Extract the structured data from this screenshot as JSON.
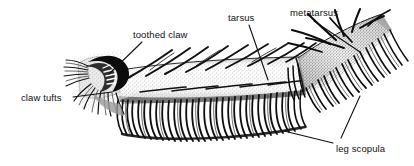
{
  "figure": {
    "kind": "scientific-illustration",
    "style": "black-and-white stippled line drawing",
    "background_color": "#ffffff",
    "ink_color": "#111111",
    "width": 414,
    "height": 166
  },
  "labels": [
    {
      "id": "claw-tufts",
      "text": "claw tufts",
      "x": 21,
      "y": 93,
      "leaders": [
        {
          "x1": 73,
          "y1": 97,
          "x2": 112,
          "y2": 92
        }
      ]
    },
    {
      "id": "toothed-claw",
      "text": "toothed claw",
      "x": 133,
      "y": 30,
      "leaders": [
        {
          "x1": 142,
          "y1": 42,
          "x2": 109,
          "y2": 74
        }
      ]
    },
    {
      "id": "tarsus",
      "text": "tarsus",
      "x": 228,
      "y": 13,
      "leaders": [
        {
          "x1": 249,
          "y1": 25,
          "x2": 268,
          "y2": 80
        }
      ]
    },
    {
      "id": "metatarsus",
      "text": "metatarsus",
      "x": 290,
      "y": 8,
      "leaders": [
        {
          "x1": 314,
          "y1": 21,
          "x2": 360,
          "y2": 52
        }
      ]
    },
    {
      "id": "leg-scopula",
      "text": "leg scopula",
      "x": 336,
      "y": 144,
      "leaders": [
        {
          "x1": 333,
          "y1": 143,
          "x2": 284,
          "y2": 131
        },
        {
          "x1": 341,
          "y1": 138,
          "x2": 360,
          "y2": 96
        }
      ]
    }
  ],
  "anatomy": {
    "tarsus_label": "tarsus",
    "metatarsus_label": "metatarsus",
    "claw_label": "toothed claw",
    "tuft_label": "claw tufts",
    "scopula_label": "leg scopula"
  }
}
